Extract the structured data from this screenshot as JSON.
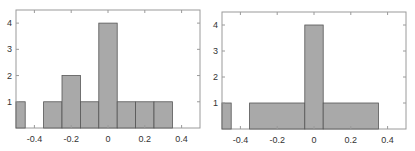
{
  "colors": {
    "bar_fill": "#a9a9a9",
    "bar_stroke": "#555555",
    "frame": "#9a9a9a",
    "text": "#333333"
  },
  "chart_data": [
    {
      "type": "bar",
      "title": "",
      "xlabel": "",
      "ylabel": "",
      "xlim": [
        -0.5,
        0.5
      ],
      "ylim": [
        0,
        4.5
      ],
      "grid": false,
      "xticks": [
        -0.4,
        -0.2,
        0,
        0.2,
        0.4
      ],
      "xtick_labels": [
        "-0.4",
        "-0.2",
        "0",
        "0.2",
        "0.4"
      ],
      "yticks": [
        1,
        2,
        3,
        4
      ],
      "ytick_labels": [
        "1",
        "2",
        "3",
        "4"
      ],
      "bins": [
        {
          "x0": -0.5,
          "x1": -0.45,
          "count": 1
        },
        {
          "x0": -0.45,
          "x1": -0.35,
          "count": 0
        },
        {
          "x0": -0.35,
          "x1": -0.25,
          "count": 1
        },
        {
          "x0": -0.25,
          "x1": -0.15,
          "count": 2
        },
        {
          "x0": -0.15,
          "x1": -0.05,
          "count": 1
        },
        {
          "x0": -0.05,
          "x1": 0.05,
          "count": 4
        },
        {
          "x0": 0.05,
          "x1": 0.15,
          "count": 1
        },
        {
          "x0": 0.15,
          "x1": 0.25,
          "count": 1
        },
        {
          "x0": 0.25,
          "x1": 0.35,
          "count": 1
        },
        {
          "x0": 0.35,
          "x1": 0.5,
          "count": 0
        }
      ]
    },
    {
      "type": "bar",
      "title": "",
      "xlabel": "",
      "ylabel": "",
      "xlim": [
        -0.5,
        0.5
      ],
      "ylim": [
        0,
        4.5
      ],
      "grid": false,
      "xticks": [
        -0.4,
        -0.2,
        0,
        0.2,
        0.4
      ],
      "xtick_labels": [
        "-0.4",
        "-0.2",
        "0",
        "0.2",
        "0.4"
      ],
      "yticks": [
        1,
        2,
        3,
        4
      ],
      "ytick_labels": [
        "1",
        "2",
        "3",
        "4"
      ],
      "bins": [
        {
          "x0": -0.5,
          "x1": -0.45,
          "count": 1
        },
        {
          "x0": -0.45,
          "x1": -0.35,
          "count": 0
        },
        {
          "x0": -0.35,
          "x1": -0.05,
          "count": 1
        },
        {
          "x0": -0.05,
          "x1": 0.05,
          "count": 4
        },
        {
          "x0": 0.05,
          "x1": 0.35,
          "count": 1
        },
        {
          "x0": 0.35,
          "x1": 0.5,
          "count": 0
        }
      ]
    }
  ]
}
